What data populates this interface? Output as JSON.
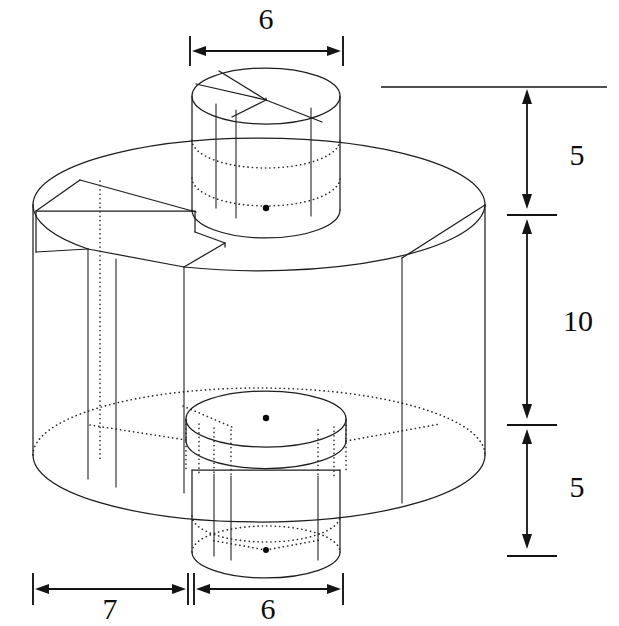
{
  "figure": {
    "type": "engineering-isometric-drawing",
    "background_color": "#ffffff",
    "line_color": "#141414",
    "hidden_line_style": "dotted"
  },
  "dimensions": {
    "top_width": {
      "value": "6",
      "label": "6",
      "orientation": "horizontal",
      "position": "top",
      "describes": "diameter of upper boss cylinder"
    },
    "height_top": {
      "value": "5",
      "label": "5",
      "orientation": "vertical",
      "position": "right-upper",
      "describes": "height of upper boss cylinder"
    },
    "height_middle": {
      "value": "10",
      "label": "10",
      "orientation": "vertical",
      "position": "right-middle",
      "describes": "height of main cylinder body"
    },
    "height_bottom": {
      "value": "5",
      "label": "5",
      "orientation": "vertical",
      "position": "right-lower",
      "describes": "height of lower boss cylinder"
    },
    "bottom_offset": {
      "value": "7",
      "label": "7",
      "orientation": "horizontal",
      "position": "bottom-left",
      "describes": "radial offset from main cylinder edge to lower boss"
    },
    "bottom_width": {
      "value": "6",
      "label": "6",
      "orientation": "horizontal",
      "position": "bottom-right",
      "describes": "diameter of lower boss cylinder"
    }
  },
  "labels": {
    "top_6": "6",
    "right_5_upper": "5",
    "right_10": "10",
    "right_5_lower": "5",
    "bottom_7": "7",
    "bottom_6": "6"
  },
  "geometry": {
    "main_cylinder": {
      "name": "main-body-cylinder",
      "center_x": 259,
      "top_ellipse_cy": 205,
      "bottom_ellipse_cy": 455,
      "rx": 226,
      "ry": 67
    },
    "top_boss": {
      "name": "upper-boss-cylinder",
      "center_x": 266,
      "top_ellipse_cy": 96,
      "bottom_ellipse_cy": 210,
      "rx": 74,
      "ry": 27
    },
    "bottom_boss": {
      "name": "lower-boss-cylinder",
      "center_x": 266,
      "top_ellipse_cy": 468,
      "bottom_ellipse_cy": 552,
      "rx": 74,
      "ry": 27
    },
    "inner_disk": {
      "name": "inner-bore-disk",
      "center_x": 266,
      "cy": 419,
      "rx": 79,
      "ry": 28
    }
  },
  "center_marks": [
    {
      "name": "upper-boss-center-mark",
      "x": 266,
      "y": 208
    },
    {
      "name": "inner-disk-center-mark",
      "x": 266,
      "y": 418
    },
    {
      "name": "lower-boss-center-mark",
      "x": 266,
      "y": 550
    }
  ]
}
